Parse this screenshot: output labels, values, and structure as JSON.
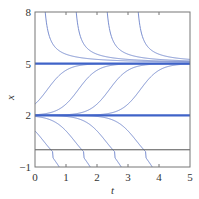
{
  "chart_data": {
    "type": "line",
    "title": "",
    "xlabel": "t",
    "ylabel": "x",
    "xlim": [
      0,
      5
    ],
    "ylim": [
      -1,
      8
    ],
    "xticks": [
      "0",
      "1",
      "2",
      "3",
      "4",
      "5"
    ],
    "yticks": [
      "-1",
      "2",
      "5",
      "8"
    ],
    "ytick_values": [
      -1,
      2,
      5,
      8
    ],
    "grid": false,
    "legend": "none",
    "equilibria": [
      {
        "name": "x = 5 (stable)",
        "value": 5,
        "emphasis": "thick"
      },
      {
        "name": "x = 2 (unstable)",
        "value": 2,
        "emphasis": "thick"
      },
      {
        "name": "x = 0",
        "value": 0,
        "emphasis": "thin"
      }
    ],
    "series": [
      {
        "name": "above-5 curve 1",
        "family": "decay-to-5",
        "enters_top_at_t": 0.3
      },
      {
        "name": "above-5 curve 2",
        "family": "decay-to-5",
        "enters_top_at_t": 1.3
      },
      {
        "name": "above-5 curve 3",
        "family": "decay-to-5",
        "enters_top_at_t": 2.3
      },
      {
        "name": "above-5 curve 4",
        "family": "decay-to-5",
        "enters_top_at_t": 3.3
      },
      {
        "name": "between curve 1",
        "family": "rise-2-to-5",
        "midpoint_t": 0.4
      },
      {
        "name": "between curve 2",
        "family": "rise-2-to-5",
        "midpoint_t": 1.4
      },
      {
        "name": "between curve 3",
        "family": "rise-2-to-5",
        "midpoint_t": 2.4
      },
      {
        "name": "between curve 4",
        "family": "rise-2-to-5",
        "midpoint_t": 3.4
      },
      {
        "name": "below-2 curve 1",
        "family": "drop-from-2",
        "exits_bottom_at_t": 1.1
      },
      {
        "name": "below-2 curve 2",
        "family": "drop-from-2",
        "exits_bottom_at_t": 2.1
      },
      {
        "name": "below-2 curve 3",
        "family": "drop-from-2",
        "exits_bottom_at_t": 3.1
      },
      {
        "name": "below-2 curve 4",
        "family": "drop-from-2",
        "exits_bottom_at_t": 4.1
      }
    ]
  },
  "colors": {
    "curve": "#7b8fd0",
    "equilibrium": "#3f63c8",
    "zero_line": "#555555",
    "frame": "#777777",
    "text": "#333333"
  }
}
